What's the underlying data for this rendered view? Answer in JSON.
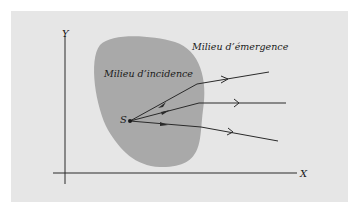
{
  "diagram": {
    "axes": {
      "x_label": "X",
      "y_label": "Y"
    },
    "regions": {
      "incidence": {
        "label": "Milieu d’incidence",
        "color": "#a9a9a9"
      },
      "emergence": {
        "label": "Milieu d’émergence",
        "color": "#e6e6e6"
      }
    },
    "source": {
      "label": "S"
    },
    "rays": [
      {
        "name": "ray-1",
        "from": [
          130,
          121
        ],
        "interface": [
          197,
          84
        ],
        "to": [
          269,
          72
        ]
      },
      {
        "name": "ray-2",
        "from": [
          130,
          121
        ],
        "interface": [
          199,
          103
        ],
        "to": [
          286,
          103
        ]
      },
      {
        "name": "ray-3",
        "from": [
          130,
          121
        ],
        "interface": [
          201,
          127
        ],
        "to": [
          278,
          141
        ]
      }
    ],
    "colors": {
      "line": "#2a2a2a",
      "background": "#e6e6e6"
    }
  }
}
